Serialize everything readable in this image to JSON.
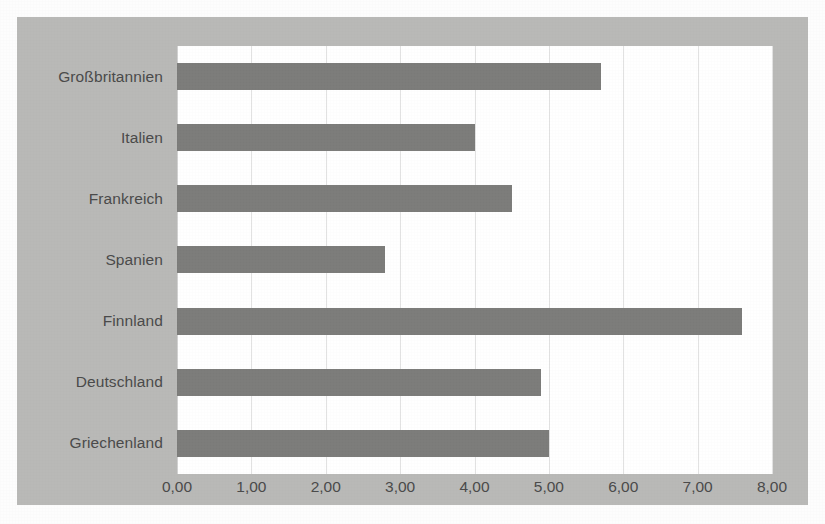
{
  "chart_data": {
    "type": "bar",
    "orientation": "horizontal",
    "title": "",
    "subtitle": "",
    "xlabel": "",
    "ylabel": "",
    "categories": [
      "Großbritannien",
      "Italien",
      "Frankreich",
      "Spanien",
      "Finnland",
      "Deutschland",
      "Griechenland"
    ],
    "values": [
      5.7,
      4.0,
      4.5,
      2.8,
      7.6,
      4.9,
      5.0
    ],
    "xlim": [
      0,
      8
    ],
    "xtick_labels": [
      "0,00",
      "1,00",
      "2,00",
      "3,00",
      "4,00",
      "5,00",
      "6,00",
      "7,00",
      "8,00"
    ],
    "xtick_values": [
      0,
      1,
      2,
      3,
      4,
      5,
      6,
      7,
      8
    ],
    "grid": "vertical",
    "legend": "none",
    "decimal_separator": ",",
    "colors": {
      "bar": "#7c7c7a",
      "plot_background": "#ffffff",
      "chart_background": "#b9b9b7",
      "gridline": "#e2e2e2",
      "text": "#4a4a4a"
    }
  }
}
